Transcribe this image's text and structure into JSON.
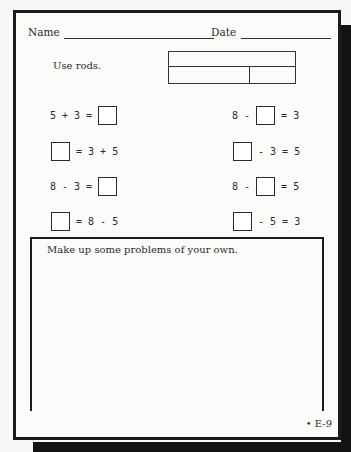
{
  "header": {
    "name_label": "Name",
    "date_label": "Date"
  },
  "instruction": "Use rods.",
  "rods_diagram": {
    "top_row": [
      "8"
    ],
    "bottom_row": [
      "5",
      "3"
    ]
  },
  "left_problems": [
    {
      "parts": [
        "5 + 3 = ",
        "□"
      ],
      "answer_position": "end"
    },
    {
      "parts": [
        "□",
        " = 3 + 5"
      ],
      "answer_position": "start"
    },
    {
      "parts": [
        "8 - 3 = ",
        "□"
      ],
      "answer_position": "end"
    },
    {
      "parts": [
        "□",
        " = 8 - 5"
      ],
      "answer_position": "start"
    }
  ],
  "right_problems": [
    {
      "before": "8 - ",
      "after": " = 3"
    },
    {
      "before": "",
      "after": " - 3 = 5"
    },
    {
      "before": "8 - ",
      "after": " = 5"
    },
    {
      "before": "",
      "after": " - 5 = 3"
    }
  ],
  "text": {
    "l1a": "5 + 3 = ",
    "l2b": " = 3 + 5",
    "l3a": "8 - 3 = ",
    "l4b": " = 8 - 5",
    "r1a": "8 - ",
    "r1b": " = 3",
    "r2b": " - 3 = 5",
    "r3a": "8 - ",
    "r3b": " = 5",
    "r4b": " - 5 = 3"
  },
  "own_problems_prompt": "Make up some problems of your own.",
  "page_number": "• E-9"
}
